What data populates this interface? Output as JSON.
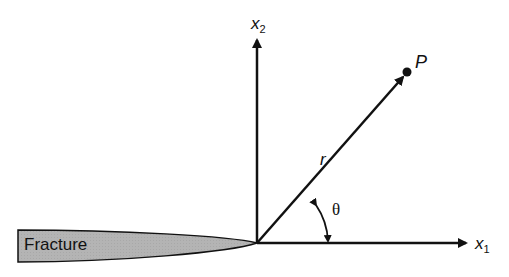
{
  "diagram": {
    "type": "crack-tip coordinate system",
    "fracture_label": "Fracture",
    "axes": {
      "x1": {
        "symbol": "x",
        "subscript": "1"
      },
      "x2": {
        "symbol": "x",
        "subscript": "2"
      }
    },
    "point_label": "P",
    "radius_label": "r",
    "angle_label": "θ",
    "colors": {
      "fracture_fill": "#b4b4b4",
      "stroke": "#111111",
      "background": "#ffffff"
    }
  }
}
